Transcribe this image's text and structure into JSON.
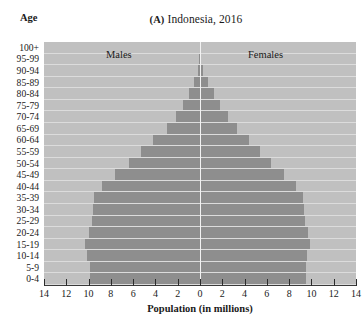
{
  "figure": {
    "age_axis_label": "Age",
    "panel_letter": "(A)",
    "title_text": "Indonesia, 2016",
    "title_full": "(A) Indonesia, 2016",
    "x_axis_title": "Population (in millions)"
  },
  "series_labels": {
    "males": "Males",
    "females": "Females"
  },
  "colors": {
    "plot_background": "#c0c0c0",
    "gridline": "#dcdcdc",
    "bar": "#8e8e8e",
    "zero_line": "#f2f2f2",
    "axis": "#2b2b2b",
    "text": "#1a1a1a"
  },
  "chart_data": {
    "type": "bar",
    "subtype": "population-pyramid",
    "xlabel": "Population (in millions)",
    "ylabel": "Age",
    "xlim": [
      -14,
      14
    ],
    "xticks": [
      -14,
      -12,
      -10,
      -8,
      -6,
      -4,
      -2,
      0,
      2,
      4,
      6,
      8,
      10,
      12,
      14
    ],
    "xtick_labels": [
      "14",
      "12",
      "10",
      "8",
      "6",
      "4",
      "2",
      "0",
      "2",
      "4",
      "6",
      "8",
      "10",
      "12",
      "14"
    ],
    "grid": true,
    "legend": "in-plot",
    "orientation": "horizontal",
    "categories": [
      "0-4",
      "5-9",
      "10-14",
      "15-19",
      "20-24",
      "25-29",
      "30-34",
      "35-39",
      "40-44",
      "45-49",
      "50-54",
      "55-59",
      "60-64",
      "65-69",
      "70-74",
      "75-79",
      "80-84",
      "85-89",
      "90-94",
      "95-99",
      "100+"
    ],
    "series": [
      {
        "name": "Males",
        "side": "left",
        "values": [
          9.9,
          9.9,
          10.1,
          10.3,
          10.0,
          9.7,
          9.6,
          9.5,
          8.8,
          7.6,
          6.4,
          5.3,
          4.2,
          3.0,
          2.2,
          1.5,
          1.0,
          0.55,
          0.2,
          0.06,
          0.02
        ]
      },
      {
        "name": "Females",
        "side": "right",
        "values": [
          9.5,
          9.5,
          9.6,
          9.9,
          9.7,
          9.4,
          9.3,
          9.2,
          8.6,
          7.5,
          6.4,
          5.4,
          4.4,
          3.3,
          2.5,
          1.8,
          1.3,
          0.75,
          0.3,
          0.08,
          0.03
        ]
      }
    ]
  }
}
